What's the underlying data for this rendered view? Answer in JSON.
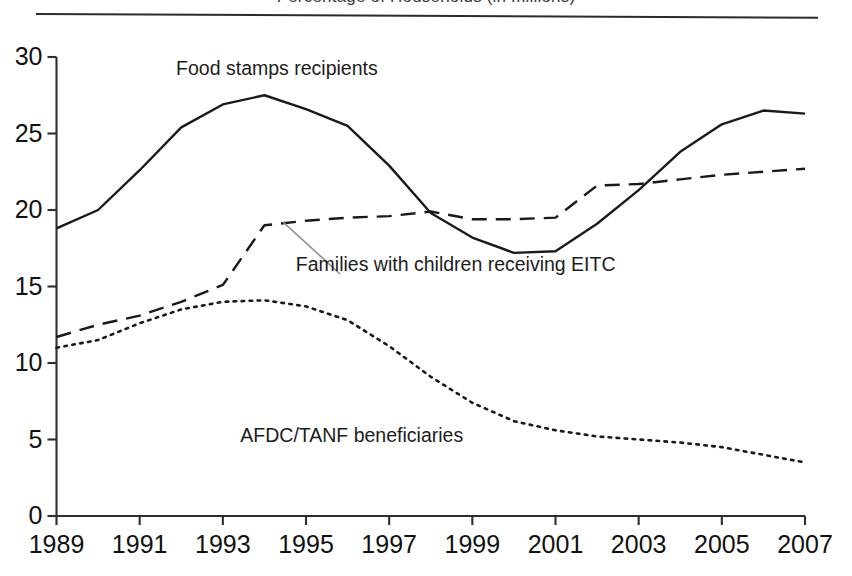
{
  "figure": {
    "title_clipped": "Percentage of Households (in millions)",
    "rule": "horizontal-rule"
  },
  "chart_data": {
    "type": "line",
    "title": "",
    "xlabel": "",
    "ylabel": "",
    "xlim": [
      1989,
      2007
    ],
    "ylim": [
      0,
      30
    ],
    "yticks": [
      0,
      5,
      10,
      15,
      20,
      25,
      30
    ],
    "xticks": [
      1989,
      1991,
      1993,
      1995,
      1997,
      1999,
      2001,
      2003,
      2005,
      2007
    ],
    "xtick_labels": [
      "1989",
      "1991",
      "1993",
      "1995",
      "1997",
      "1999",
      "2001",
      "2003",
      "2005",
      "2007"
    ],
    "ytick_labels": [
      "0",
      "5",
      "10",
      "15",
      "20",
      "25",
      "30"
    ],
    "grid": false,
    "legend": "inline-annotations",
    "x": [
      1989,
      1990,
      1991,
      1992,
      1993,
      1994,
      1995,
      1996,
      1997,
      1998,
      1999,
      2000,
      2001,
      2002,
      2003,
      2004,
      2005,
      2006,
      2007
    ],
    "series": [
      {
        "name": "Food stamps recipients",
        "style": "solid",
        "color": "#1a1a1a",
        "values": [
          18.8,
          20.0,
          22.6,
          25.4,
          26.9,
          27.5,
          26.6,
          25.5,
          22.9,
          19.8,
          18.2,
          17.2,
          17.3,
          19.1,
          21.3,
          23.8,
          25.6,
          26.5,
          26.3
        ]
      },
      {
        "name": "Families with children receiving EITC",
        "style": "dashed",
        "color": "#1a1a1a",
        "values": [
          11.7,
          12.5,
          13.1,
          14.0,
          15.1,
          19.0,
          19.3,
          19.5,
          19.6,
          19.9,
          19.4,
          19.4,
          19.5,
          21.6,
          21.7,
          22.0,
          22.3,
          22.5,
          22.7
        ]
      },
      {
        "name": "AFDC/TANF beneficiaries",
        "style": "dotted",
        "color": "#1a1a1a",
        "values": [
          11.0,
          11.5,
          12.6,
          13.5,
          14.0,
          14.1,
          13.7,
          12.8,
          11.1,
          9.1,
          7.4,
          6.2,
          5.6,
          5.2,
          5.0,
          4.8,
          4.5,
          4.0,
          3.5
        ]
      }
    ],
    "annotations": [
      {
        "name": "food-stamps-annotation",
        "text": "Food stamps recipients",
        "x": 1994.3,
        "y": 29.2
      },
      {
        "name": "eitc-annotation",
        "text": "Families with children receiving EITC",
        "x": 1998.6,
        "y": 16.4,
        "leader": true
      },
      {
        "name": "afdc-tanf-annotation",
        "text": "AFDC/TANF beneficiaries",
        "x": 1996.1,
        "y": 5.2
      }
    ]
  }
}
